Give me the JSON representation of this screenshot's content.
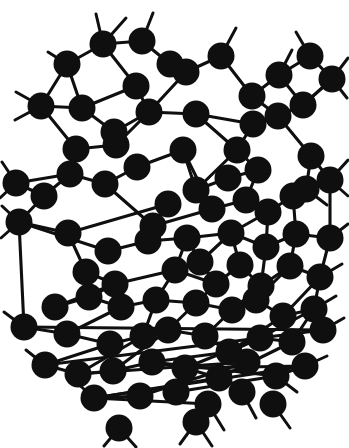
{
  "figure": {
    "title": "",
    "caption": "",
    "kind": "continuous-random-network-diagram",
    "background_color": "#ffffff",
    "atom_color": "#100f0f",
    "bond_color": "#100f0f",
    "atom_radius_px": 13.5,
    "bond_width_px": 3.1,
    "canvas": {
      "width": 349,
      "height": 448
    },
    "atom_count": 93,
    "bond_count": 139,
    "dangling_bond_count": 36,
    "legend": [],
    "axis_labels": [],
    "annotations": []
  },
  "chart_data": {
    "type": "scatter",
    "title": "",
    "xlabel": "",
    "ylabel": "",
    "xlim": [
      0,
      349
    ],
    "ylim": [
      0,
      448
    ],
    "grid": false,
    "legend_position": "none",
    "atom_radius": 13.5,
    "atoms": [
      [
        103,
        44
      ],
      [
        142,
        41
      ],
      [
        67,
        64
      ],
      [
        136,
        86
      ],
      [
        41,
        106
      ],
      [
        82,
        108
      ],
      [
        170,
        64
      ],
      [
        186,
        72
      ],
      [
        221,
        56
      ],
      [
        279,
        75
      ],
      [
        252,
        96
      ],
      [
        114,
        132
      ],
      [
        149,
        112
      ],
      [
        196,
        114
      ],
      [
        253,
        124
      ],
      [
        76,
        149
      ],
      [
        116,
        145
      ],
      [
        237,
        150
      ],
      [
        278,
        116
      ],
      [
        303,
        105
      ],
      [
        310,
        56
      ],
      [
        332,
        79
      ],
      [
        311,
        156
      ],
      [
        70,
        174
      ],
      [
        105,
        184
      ],
      [
        137,
        167
      ],
      [
        183,
        150
      ],
      [
        196,
        190
      ],
      [
        228,
        178
      ],
      [
        258,
        170
      ],
      [
        306,
        189
      ],
      [
        16,
        183
      ],
      [
        44,
        196
      ],
      [
        168,
        204
      ],
      [
        153,
        226
      ],
      [
        212,
        209
      ],
      [
        246,
        200
      ],
      [
        268,
        212
      ],
      [
        293,
        196
      ],
      [
        330,
        180
      ],
      [
        19,
        222
      ],
      [
        68,
        233
      ],
      [
        108,
        251
      ],
      [
        148,
        241
      ],
      [
        187,
        238
      ],
      [
        200,
        262
      ],
      [
        231,
        233
      ],
      [
        266,
        247
      ],
      [
        296,
        234
      ],
      [
        330,
        238
      ],
      [
        86,
        272
      ],
      [
        115,
        284
      ],
      [
        175,
        270
      ],
      [
        216,
        284
      ],
      [
        240,
        265
      ],
      [
        261,
        286
      ],
      [
        290,
        266
      ],
      [
        320,
        277
      ],
      [
        55,
        307
      ],
      [
        89,
        297
      ],
      [
        121,
        307
      ],
      [
        156,
        300
      ],
      [
        196,
        303
      ],
      [
        232,
        310
      ],
      [
        256,
        300
      ],
      [
        283,
        316
      ],
      [
        314,
        309
      ],
      [
        24,
        327
      ],
      [
        67,
        334
      ],
      [
        110,
        344
      ],
      [
        143,
        336
      ],
      [
        168,
        330
      ],
      [
        205,
        336
      ],
      [
        229,
        352
      ],
      [
        260,
        338
      ],
      [
        292,
        342
      ],
      [
        323,
        330
      ],
      [
        45,
        365
      ],
      [
        78,
        374
      ],
      [
        113,
        371
      ],
      [
        152,
        362
      ],
      [
        185,
        368
      ],
      [
        219,
        378
      ],
      [
        247,
        362
      ],
      [
        276,
        376
      ],
      [
        305,
        366
      ],
      [
        94,
        398
      ],
      [
        140,
        396
      ],
      [
        176,
        392
      ],
      [
        208,
        404
      ],
      [
        242,
        392
      ],
      [
        273,
        404
      ],
      [
        119,
        428
      ],
      [
        196,
        422
      ]
    ],
    "bonds": [
      [
        0,
        1
      ],
      [
        0,
        2
      ],
      [
        2,
        4
      ],
      [
        2,
        5
      ],
      [
        0,
        3
      ],
      [
        3,
        5
      ],
      [
        3,
        12
      ],
      [
        1,
        6
      ],
      [
        6,
        7
      ],
      [
        7,
        8
      ],
      [
        7,
        12
      ],
      [
        8,
        10
      ],
      [
        10,
        9
      ],
      [
        9,
        19
      ],
      [
        9,
        20
      ],
      [
        20,
        21
      ],
      [
        19,
        21
      ],
      [
        19,
        18
      ],
      [
        18,
        10
      ],
      [
        18,
        14
      ],
      [
        4,
        5
      ],
      [
        5,
        11
      ],
      [
        11,
        12
      ],
      [
        12,
        16
      ],
      [
        11,
        16
      ],
      [
        16,
        15
      ],
      [
        15,
        23
      ],
      [
        4,
        15
      ],
      [
        14,
        13
      ],
      [
        13,
        12
      ],
      [
        13,
        17
      ],
      [
        14,
        17
      ],
      [
        17,
        27
      ],
      [
        27,
        26
      ],
      [
        26,
        25
      ],
      [
        25,
        24
      ],
      [
        24,
        23
      ],
      [
        23,
        31
      ],
      [
        23,
        32
      ],
      [
        31,
        32
      ],
      [
        32,
        40
      ],
      [
        40,
        41
      ],
      [
        41,
        33
      ],
      [
        33,
        34
      ],
      [
        34,
        24
      ],
      [
        34,
        35
      ],
      [
        35,
        26
      ],
      [
        35,
        27
      ],
      [
        27,
        28
      ],
      [
        28,
        29
      ],
      [
        29,
        17
      ],
      [
        29,
        36
      ],
      [
        36,
        35
      ],
      [
        36,
        37
      ],
      [
        37,
        38
      ],
      [
        38,
        30
      ],
      [
        30,
        22
      ],
      [
        22,
        18
      ],
      [
        22,
        39
      ],
      [
        39,
        30
      ],
      [
        39,
        49
      ],
      [
        40,
        42
      ],
      [
        42,
        43
      ],
      [
        43,
        34
      ],
      [
        43,
        44
      ],
      [
        44,
        45
      ],
      [
        45,
        46
      ],
      [
        46,
        44
      ],
      [
        46,
        37
      ],
      [
        46,
        47
      ],
      [
        47,
        37
      ],
      [
        47,
        48
      ],
      [
        48,
        38
      ],
      [
        48,
        49
      ],
      [
        41,
        50
      ],
      [
        50,
        51
      ],
      [
        51,
        52
      ],
      [
        52,
        44
      ],
      [
        52,
        53
      ],
      [
        53,
        45
      ],
      [
        53,
        54
      ],
      [
        54,
        46
      ],
      [
        54,
        55
      ],
      [
        55,
        47
      ],
      [
        55,
        56
      ],
      [
        56,
        48
      ],
      [
        56,
        57
      ],
      [
        57,
        49
      ],
      [
        58,
        51
      ],
      [
        58,
        59
      ],
      [
        59,
        51
      ],
      [
        59,
        60
      ],
      [
        60,
        61
      ],
      [
        61,
        52
      ],
      [
        61,
        62
      ],
      [
        62,
        53
      ],
      [
        62,
        63
      ],
      [
        63,
        55
      ],
      [
        63,
        64
      ],
      [
        64,
        56
      ],
      [
        64,
        65
      ],
      [
        65,
        57
      ],
      [
        65,
        66
      ],
      [
        66,
        57
      ],
      [
        67,
        40
      ],
      [
        67,
        68
      ],
      [
        68,
        60
      ],
      [
        68,
        69
      ],
      [
        69,
        70
      ],
      [
        70,
        61
      ],
      [
        70,
        71
      ],
      [
        71,
        62
      ],
      [
        71,
        72
      ],
      [
        72,
        63
      ],
      [
        72,
        73
      ],
      [
        73,
        65
      ],
      [
        73,
        74
      ],
      [
        74,
        66
      ],
      [
        74,
        75
      ],
      [
        75,
        66
      ],
      [
        76,
        67
      ],
      [
        76,
        77
      ],
      [
        77,
        69
      ],
      [
        77,
        78
      ],
      [
        78,
        70
      ],
      [
        78,
        79
      ],
      [
        79,
        71
      ],
      [
        79,
        80
      ],
      [
        80,
        73
      ],
      [
        80,
        81
      ],
      [
        81,
        74
      ],
      [
        81,
        82
      ],
      [
        82,
        75
      ],
      [
        83,
        78
      ],
      [
        84,
        80
      ],
      [
        84,
        85
      ],
      [
        85,
        81
      ],
      [
        85,
        86
      ],
      [
        86,
        82
      ],
      [
        86,
        87
      ],
      [
        87,
        83
      ],
      [
        88,
        84
      ],
      [
        89,
        86
      ]
    ],
    "dangling_bonds": [
      [
        103,
        44,
        96,
        14
      ],
      [
        103,
        44,
        126,
        18
      ],
      [
        67,
        64,
        48,
        52
      ],
      [
        142,
        41,
        153,
        13
      ],
      [
        221,
        56,
        236,
        28
      ],
      [
        279,
        75,
        292,
        50
      ],
      [
        310,
        56,
        296,
        32
      ],
      [
        332,
        79,
        348,
        58
      ],
      [
        332,
        79,
        347,
        98
      ],
      [
        41,
        106,
        16,
        92
      ],
      [
        41,
        106,
        15,
        120
      ],
      [
        16,
        183,
        2,
        162
      ],
      [
        16,
        183,
        0,
        198
      ],
      [
        19,
        222,
        2,
        206
      ],
      [
        19,
        222,
        1,
        238
      ],
      [
        303,
        105,
        322,
        88
      ],
      [
        330,
        180,
        348,
        160
      ],
      [
        330,
        180,
        348,
        196
      ],
      [
        306,
        189,
        327,
        205
      ],
      [
        330,
        238,
        348,
        224
      ],
      [
        320,
        277,
        342,
        264
      ],
      [
        24,
        327,
        4,
        312
      ],
      [
        314,
        309,
        336,
        296
      ],
      [
        323,
        330,
        344,
        318
      ],
      [
        45,
        365,
        26,
        350
      ],
      [
        305,
        366,
        327,
        356
      ],
      [
        276,
        376,
        297,
        392
      ],
      [
        273,
        404,
        290,
        428
      ],
      [
        242,
        392,
        256,
        418
      ],
      [
        208,
        404,
        192,
        428
      ],
      [
        208,
        404,
        224,
        430
      ],
      [
        119,
        428,
        104,
        446
      ],
      [
        119,
        428,
        136,
        447
      ],
      [
        196,
        422,
        180,
        444
      ],
      [
        196,
        422,
        212,
        446
      ],
      [
        94,
        398,
        76,
        382
      ]
    ]
  }
}
